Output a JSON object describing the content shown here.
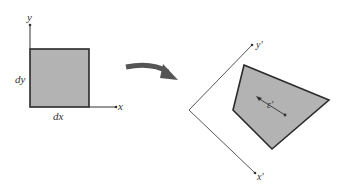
{
  "diagram": {
    "type": "strain-transformation",
    "left_figure": {
      "axes": {
        "x_label": "x",
        "y_label": "y"
      },
      "element": {
        "width_label": "dx",
        "height_label": "dy",
        "fill": "#b3b3b3",
        "stroke": "#2a2a2a"
      }
    },
    "transition_arrow": {
      "color": "#555555",
      "direction": "left-to-right"
    },
    "right_figure": {
      "axes": {
        "x_label": "x'",
        "y_label": "y'"
      },
      "element": {
        "shape": "quadrilateral",
        "fill": "#b3b3b3",
        "stroke": "#2a2a2a"
      },
      "strain_label": "ε'"
    }
  }
}
